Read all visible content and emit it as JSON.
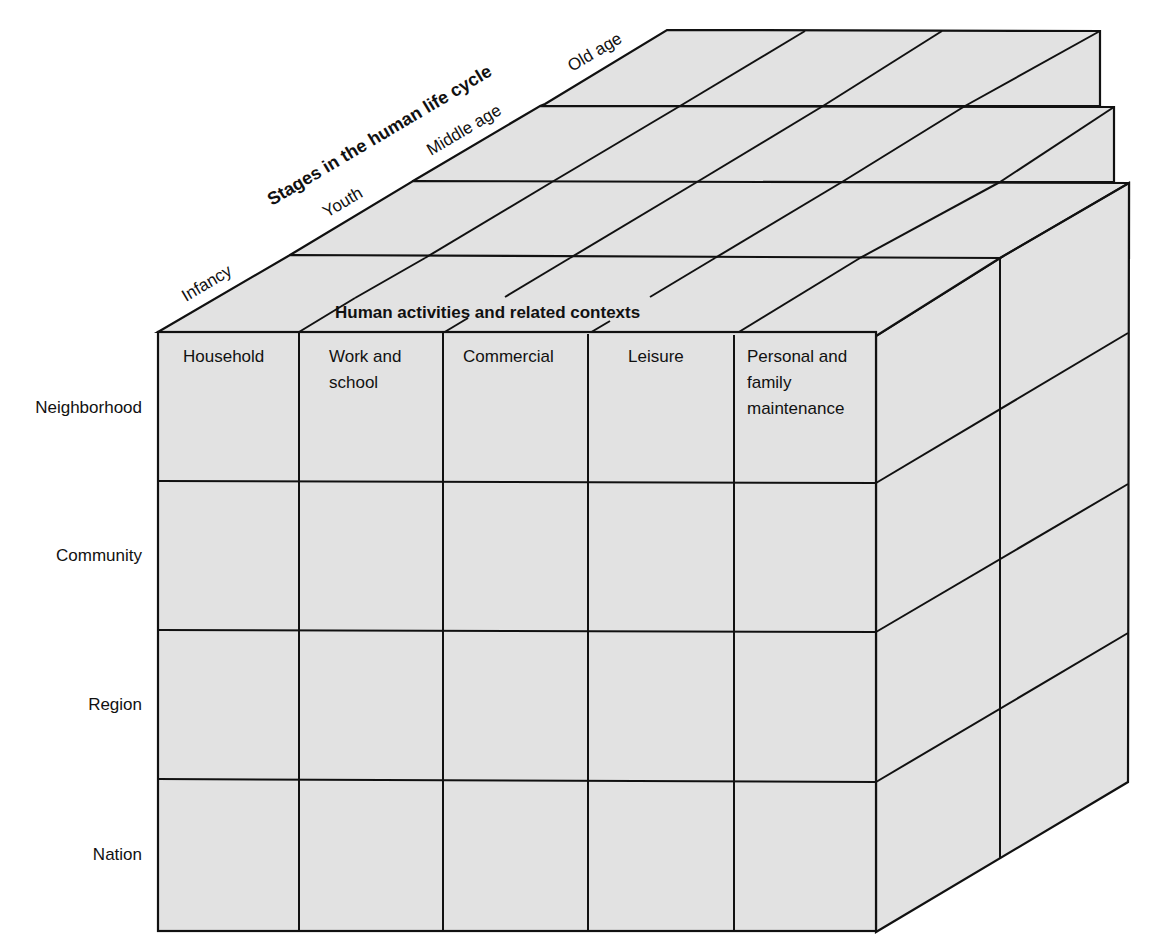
{
  "diagram": {
    "type": "three-dimensional matrix (cube)",
    "axes": {
      "depth": {
        "title": "Stages in the human life cycle",
        "items": [
          "Infancy",
          "Youth",
          "Middle age",
          "Old age"
        ]
      },
      "columns": {
        "title": "Human activities and related contexts",
        "items": [
          {
            "lines": [
              "Household"
            ]
          },
          {
            "lines": [
              "Work and",
              "school"
            ]
          },
          {
            "lines": [
              "Commercial"
            ]
          },
          {
            "lines": [
              "Leisure"
            ]
          },
          {
            "lines": [
              "Personal and",
              "family",
              "maintenance"
            ]
          }
        ]
      },
      "rows": {
        "items": [
          "Neighborhood",
          "Community",
          "Region",
          "Nation"
        ]
      }
    },
    "colors": {
      "fill": "#e2e2e2",
      "stroke": "#111111"
    }
  }
}
